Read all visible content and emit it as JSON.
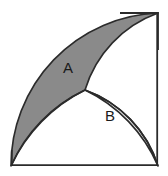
{
  "figure": {
    "background_color": "#ffffff",
    "stroke_color": "#2b2b2b",
    "stroke_width": 1.6,
    "square": {
      "label": "bounding-square",
      "left": 11,
      "top": 13,
      "right": 158,
      "bottom": 166,
      "width": 147,
      "height": 153,
      "edges_drawn": [
        "top",
        "right",
        "bottom",
        "left-partial"
      ],
      "fill": "#ffffff"
    },
    "arcs": [
      {
        "name": "large-quarter-arc",
        "center": [
          11,
          166
        ],
        "radius": 153,
        "from": [
          11,
          13
        ],
        "to": [
          158,
          166
        ],
        "description": "quarter circle centered at bottom-left corner, radius equal to square side"
      },
      {
        "name": "small-quarter-arc",
        "center": [
          11,
          166
        ],
        "radius": 85,
        "from": [
          11,
          81
        ],
        "to": [
          96,
          166
        ],
        "description": "inner quarter circle centered at bottom-left corner"
      },
      {
        "name": "top-right-arc",
        "center": [
          158,
          166
        ],
        "radius": 153,
        "from": [
          158,
          13
        ],
        "to": [
          11,
          166
        ],
        "description": "quarter circle centered at bottom-right corner passing through top-right and bottom-left"
      }
    ],
    "regions": [
      {
        "id": "A",
        "label": "A",
        "fill_color": "#8a8a8a",
        "label_x": 68,
        "label_y": 69,
        "description": "dark crescent between the large quarter arc and the inner arc, upper-left lune"
      },
      {
        "id": "B",
        "label": "B",
        "fill_color": "#e3e3e3",
        "label_x": 110,
        "label_y": 117,
        "description": "light lens below the arc intersection toward the bottom-right"
      }
    ],
    "intersection_point": [
      85,
      90
    ]
  }
}
